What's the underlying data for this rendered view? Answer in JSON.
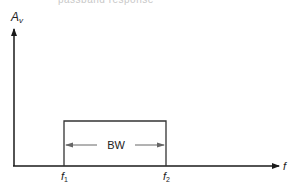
{
  "diagram": {
    "type": "ideal-bandpass-response",
    "top_fragment": "passband response",
    "y_axis": {
      "label": "A",
      "subscript": "v"
    },
    "x_axis": {
      "label": "f"
    },
    "markers": [
      {
        "label": "f",
        "subscript": "1"
      },
      {
        "label": "f",
        "subscript": "2"
      }
    ],
    "bandwidth_label": "BW",
    "colors": {
      "axis": "#1a1a1a",
      "box": "#333333",
      "bw_arrow": "#666666",
      "text": "#222222"
    }
  }
}
